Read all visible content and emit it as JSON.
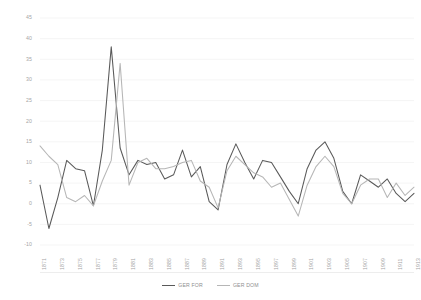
{
  "chart_data": {
    "type": "line",
    "title": "",
    "subtitle": "",
    "xlabel": "",
    "ylabel": "",
    "grid": "horizontal",
    "legend_position": "bottom-center",
    "ylim": [
      -10,
      45
    ],
    "yticks": [
      45,
      40,
      35,
      30,
      25,
      20,
      15,
      10,
      5,
      0,
      -5,
      -10
    ],
    "xlim": [
      1871,
      1913
    ],
    "x": [
      1871,
      1872,
      1873,
      1874,
      1875,
      1876,
      1877,
      1878,
      1879,
      1880,
      1881,
      1882,
      1883,
      1884,
      1885,
      1886,
      1887,
      1888,
      1889,
      1890,
      1891,
      1892,
      1893,
      1894,
      1895,
      1896,
      1897,
      1898,
      1899,
      1900,
      1901,
      1902,
      1903,
      1904,
      1905,
      1906,
      1907,
      1908,
      1909,
      1910,
      1911,
      1912,
      1913
    ],
    "xticks": [
      "1871",
      "1873",
      "1875",
      "1877",
      "1879",
      "1881",
      "1883",
      "1885",
      "1887",
      "1889",
      "1891",
      "1893",
      "1895",
      "1897",
      "1899",
      "1901",
      "1903",
      "1905",
      "1907",
      "1909",
      "1911",
      "1913"
    ],
    "series": [
      {
        "name": "GER FOR",
        "color": "#595959",
        "values": [
          4.5,
          -6.0,
          1.5,
          10.5,
          8.5,
          8.0,
          -0.5,
          13.0,
          38.0,
          13.5,
          7.0,
          10.5,
          9.5,
          10.0,
          6.0,
          7.0,
          13.0,
          6.5,
          9.0,
          0.5,
          -1.5,
          9.5,
          14.5,
          10.0,
          6.0,
          10.5,
          10.0,
          6.5,
          3.0,
          0.0,
          8.5,
          13.0,
          15.0,
          11.0,
          3.0,
          0.0,
          7.0,
          5.5,
          4.0,
          6.0,
          2.5,
          0.5,
          2.5
        ]
      },
      {
        "name": "GER DOM",
        "color": "#b6b6b6",
        "values": [
          14.0,
          11.5,
          9.5,
          1.5,
          0.5,
          2.0,
          -0.5,
          5.5,
          10.5,
          34.0,
          4.5,
          10.0,
          11.0,
          8.5,
          8.5,
          9.0,
          10.0,
          10.5,
          5.5,
          4.0,
          -1.0,
          8.0,
          11.5,
          9.5,
          7.5,
          6.5,
          4.0,
          5.0,
          1.0,
          -3.0,
          4.5,
          9.0,
          11.5,
          9.0,
          2.5,
          0.0,
          4.5,
          6.0,
          6.0,
          1.5,
          5.0,
          2.0,
          4.0
        ]
      }
    ]
  }
}
